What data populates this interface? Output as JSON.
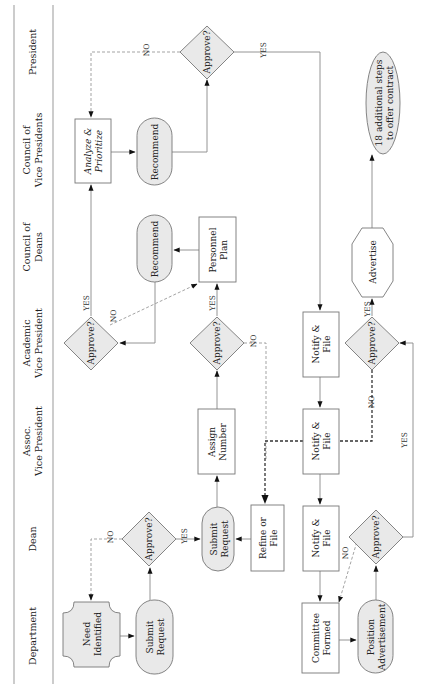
{
  "lanes": [
    {
      "label_lines": [
        "President"
      ]
    },
    {
      "label_lines": [
        "Council of",
        "Vice Presidents"
      ]
    },
    {
      "label_lines": [
        "Council of",
        "Deans"
      ]
    },
    {
      "label_lines": [
        "Academic",
        "Vice President"
      ]
    },
    {
      "label_lines": [
        "Assoc.",
        "Vice President"
      ]
    },
    {
      "label_lines": [
        "Dean"
      ]
    },
    {
      "label_lines": [
        "Department"
      ]
    }
  ],
  "nodes": {
    "president_approve": {
      "lines": [
        "Approve?"
      ]
    },
    "analyze_prioritize": {
      "lines": [
        "Analyze &",
        "Prioritize"
      ]
    },
    "cvp_recommend": {
      "lines": [
        "Recommend"
      ]
    },
    "cod_recommend": {
      "lines": [
        "Recommend"
      ]
    },
    "personnel_plan": {
      "lines": [
        "Personnel",
        "Plan"
      ]
    },
    "avp_approve_1": {
      "lines": [
        "Approve?"
      ]
    },
    "avp_approve_2": {
      "lines": [
        "Approve?"
      ]
    },
    "avp_notify": {
      "lines": [
        "Notify &",
        "File"
      ]
    },
    "avp_approve_3": {
      "lines": [
        "Approve?"
      ]
    },
    "advertise": {
      "lines": [
        "Advertise"
      ]
    },
    "additional_steps": {
      "lines": [
        "18 additional steps",
        "to offer contract"
      ]
    },
    "assign_number": {
      "lines": [
        "Assign",
        "Number"
      ]
    },
    "assoc_notify": {
      "lines": [
        "Notify &",
        "File"
      ]
    },
    "dean_approve_1": {
      "lines": [
        "Approve?"
      ]
    },
    "dean_submit": {
      "lines": [
        "Submit",
        "Request"
      ]
    },
    "refine_file": {
      "lines": [
        "Refine or",
        "File"
      ]
    },
    "dean_notify": {
      "lines": [
        "Notify &",
        "File"
      ]
    },
    "dean_approve_2": {
      "lines": [
        "Approve?"
      ]
    },
    "need_identified": {
      "lines": [
        "Need",
        "Identified"
      ]
    },
    "dept_submit": {
      "lines": [
        "Submit",
        "Request"
      ]
    },
    "committee_formed": {
      "lines": [
        "Committee",
        "Formed"
      ]
    },
    "position_ad": {
      "lines": [
        "Position",
        "Advertisement"
      ]
    }
  },
  "edge_labels": {
    "yes": "YES",
    "no": "NO"
  },
  "colors": {
    "shape_fill": "#e9e9e9",
    "stroke": "#777777",
    "text": "#222222"
  }
}
